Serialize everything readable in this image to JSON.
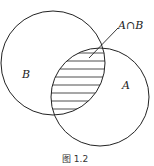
{
  "diagram": {
    "type": "venn",
    "sets": [
      {
        "name": "A",
        "label": "A"
      },
      {
        "name": "B",
        "label": "B"
      }
    ],
    "intersection_label": "A∩B",
    "shaded_region": "intersection",
    "caption": "图  1.2"
  }
}
